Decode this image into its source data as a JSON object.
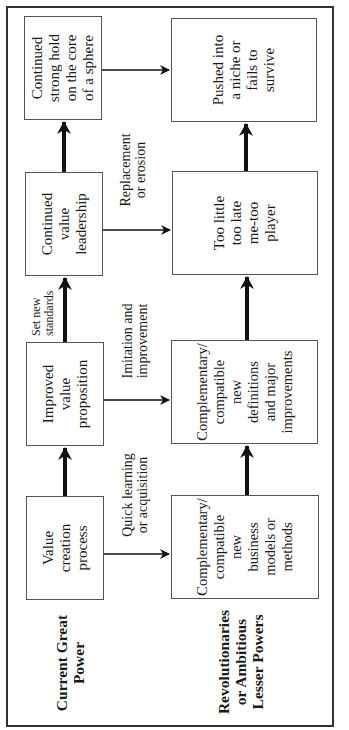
{
  "diagram": {
    "rows": [
      {
        "id": "great-power",
        "label": "Current Great\nPower"
      },
      {
        "id": "challengers",
        "label": "Revolutionaries\nor Ambitious\nLesser Powers"
      }
    ],
    "top_boxes": [
      {
        "id": "value-creation-process",
        "text": "Value\ncreation\nprocess"
      },
      {
        "id": "improved-value-proposition",
        "text": "Improved\nvalue\nproposition"
      },
      {
        "id": "continued-value-leadership",
        "text": "Continued\nvalue\nleadership"
      },
      {
        "id": "continued-strong-hold",
        "text": "Continued\nstrong hold\non the core\nof a sphere"
      }
    ],
    "bottom_boxes": [
      {
        "id": "new-business-models",
        "text": "Complementary/\ncompatible\nnew\nbusiness\nmodels or\nmethods"
      },
      {
        "id": "new-definitions",
        "text": "Complementary/\ncompatible\nnew\ndefinitions\nand major\nimprovements"
      },
      {
        "id": "too-little-too-late",
        "text": "Too little\ntoo late\nme-too\nplayer"
      },
      {
        "id": "pushed-into-niche",
        "text": "Pushed into\na niche or\nfails to\nsurvive"
      }
    ],
    "edge_labels": {
      "quick_learning": "Quick learning\nor acquisition",
      "imitation": "Imitation and\nimprovement",
      "set_standards": "Set new\nstandards",
      "replacement": "Replacement\nor erosion"
    }
  }
}
